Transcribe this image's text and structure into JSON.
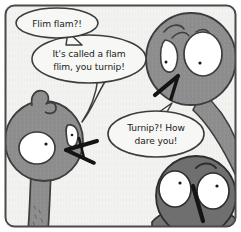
{
  "panel": {
    "kind": "comic-panel",
    "width": 241,
    "height": 232,
    "border_color": "#4a4a4a",
    "background_color": "#f2f2f0",
    "outer_margin_color": "#ffffff"
  },
  "speech_bubbles": [
    {
      "id": "bubble-1",
      "name": "speech-bubble-flim-flam",
      "lines": [
        "Flim flam?!"
      ],
      "speaker": "bottom-right-bird",
      "fill": "#f7f7f5",
      "stroke": "#3d3d3d"
    },
    {
      "id": "bubble-2",
      "name": "speech-bubble-its-called-a-flam-flim",
      "lines": [
        "It's called a flam",
        "flim, you turnip!"
      ],
      "italic_word": "flim,",
      "line2_rest": " you turnip!",
      "speaker": "left-bird",
      "fill": "#f7f7f5",
      "stroke": "#3d3d3d"
    },
    {
      "id": "bubble-3",
      "name": "speech-bubble-turnip-how-dare-you",
      "lines": [
        "Turnip?! How",
        "dare you!"
      ],
      "speaker": "top-right-bird",
      "fill": "#f7f7f5",
      "stroke": "#3d3d3d"
    }
  ],
  "characters": [
    {
      "id": "char-top-right",
      "name": "bird-top-right",
      "description": "round gray bird head with crest, two white eyes, angular black beak, neck curving to right edge",
      "body_color": "#8f8f8f",
      "eye_color": "#ffffff",
      "outline_color": "#3d3d3d",
      "pupil_color": "#1a1a1a"
    },
    {
      "id": "char-left",
      "name": "bird-left",
      "description": "gray bird with hooked tuft on head, large white eye, small angry eye, X-shaped open beak, long neck and body",
      "body_color": "#8a8a8a",
      "eye_color": "#ffffff",
      "outline_color": "#3d3d3d",
      "pupil_color": "#1a1a1a"
    },
    {
      "id": "char-bottom-right",
      "name": "bird-bottom-right",
      "description": "dark gray round bird head with two large white eyes, raised eyebrow, diagonal black beak",
      "body_color": "#6e6e6e",
      "eye_color": "#ffffff",
      "outline_color": "#2e2e2e",
      "pupil_color": "#1a1a1a"
    }
  ]
}
